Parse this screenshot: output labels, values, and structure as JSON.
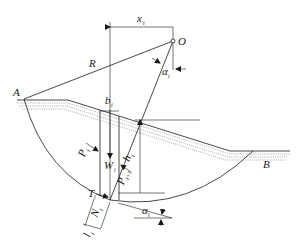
{
  "diagram": {
    "labels": {
      "center": "O",
      "radius": "R",
      "point_a": "A",
      "point_b": "B",
      "x": {
        "main": "x",
        "sub": "i"
      },
      "alpha_top": {
        "main": "α",
        "sub": "i"
      },
      "b": {
        "main": "b",
        "sub": "i"
      },
      "w": {
        "main": "W",
        "sub": "i"
      },
      "h": {
        "main": "h",
        "sub": "i"
      },
      "p": {
        "main": "P",
        "sub": "i"
      },
      "p_next": {
        "main": "P",
        "sub": "i+1"
      },
      "t": {
        "main": "T",
        "sub": "i"
      },
      "n": {
        "main": "N",
        "sub": "i"
      },
      "l": {
        "main": "l",
        "sub": "i"
      },
      "alpha_bottom": {
        "main": "α",
        "sub": "i"
      }
    },
    "colors": {
      "line": "#1a1a1a",
      "background": "#ffffff"
    }
  }
}
